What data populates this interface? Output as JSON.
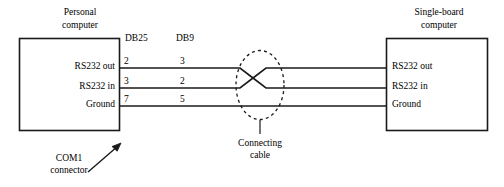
{
  "diagram": {
    "title_left": "Personal\ncomputer",
    "title_left_line1": "Personal",
    "title_left_line2": "computer",
    "title_right_line1": "Single-board",
    "title_right_line2": "computer",
    "column_headers": {
      "db25": "DB25",
      "db9": "DB9"
    },
    "signals": [
      {
        "left_label": "RS232 out",
        "right_label": "RS232 out",
        "db25_pin": "2",
        "db9_pin": "3"
      },
      {
        "left_label": "RS232 in",
        "right_label": "RS232 in",
        "db25_pin": "3",
        "db9_pin": "2"
      },
      {
        "left_label": "Ground",
        "right_label": "Ground",
        "db25_pin": "7",
        "db9_pin": "5"
      }
    ],
    "annotations": {
      "com_connector_line1": "COM1",
      "com_connector_line2": "connector",
      "connecting_cable_line1": "Connecting",
      "connecting_cable_line2": "cable"
    },
    "colors": {
      "stroke": "#1a1a1a",
      "background": "#ffffff",
      "text": "#000000"
    }
  }
}
